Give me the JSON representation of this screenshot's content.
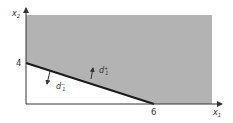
{
  "diagram": {
    "type": "goal-programming-region",
    "axes": {
      "x_label": "x",
      "x_sub": "1",
      "y_label": "x",
      "y_sub": "2"
    },
    "ticks": {
      "y_intercept": "4",
      "x_intercept": "6"
    },
    "deviations": {
      "plus": {
        "base": "d",
        "sup": "+",
        "sub": "1"
      },
      "minus": {
        "base": "d",
        "sup": "−",
        "sub": "1"
      }
    },
    "colors": {
      "region": "#b3b3b3",
      "line": "#1a1a1a",
      "axis": "#333333",
      "background": "#ffffff"
    }
  }
}
